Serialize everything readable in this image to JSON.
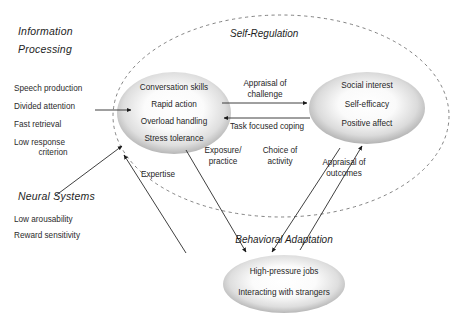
{
  "diagram": {
    "outer_boundary": {
      "label": "Self-Regulation",
      "style": "dashed-ellipse"
    },
    "left_panels": [
      {
        "heading_line1": "Information",
        "heading_line2": "Processing",
        "items": [
          "Speech production",
          "Divided attention",
          "Fast retrieval"
        ],
        "wrapped_item_line1": "Low response",
        "wrapped_item_line2": "criterion"
      },
      {
        "heading": "Neural Systems",
        "items": [
          "Low arousability",
          "Reward sensitivity"
        ]
      }
    ],
    "nodes": [
      {
        "name": "capability-node",
        "items": [
          "Conversation skills",
          "Rapid action",
          "Overload handling",
          "Stress tolerance"
        ]
      },
      {
        "name": "appraisal-node",
        "items": [
          "Social interest",
          "Self-efficacy",
          "Positive affect"
        ]
      },
      {
        "name": "behavior-node",
        "title": "Behavioral Adaptation",
        "items": [
          "High-pressure jobs",
          "Interacting with strangers"
        ]
      }
    ],
    "arrow_labels": {
      "appraisal_of_challenge_line1": "Appraisal of",
      "appraisal_of_challenge_line2": "challenge",
      "task_focused_coping": "Task focused coping",
      "expertise": "Expertise",
      "exposure_practice_line1": "Exposure/",
      "exposure_practice_line2": "practice",
      "choice_of_activity_line1": "Choice of",
      "choice_of_activity_line2": "activity",
      "appraisal_of_outcomes_line1": "Appraisal of",
      "appraisal_of_outcomes_line2": "outcomes"
    },
    "colors": {
      "ellipse_edge": "#8f8f8f",
      "ellipse_center": "#fdfdfd",
      "line": "#555555",
      "text": "#2b2b2b",
      "background": "#ffffff"
    }
  }
}
